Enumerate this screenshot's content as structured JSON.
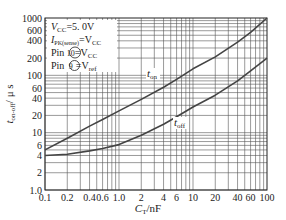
{
  "chart_data": {
    "type": "line",
    "title": "",
    "xlabel": "C_T/nF",
    "ylabel": "t_on-off / μs",
    "xscale": "log",
    "yscale": "log",
    "xlim": [
      0.1,
      100
    ],
    "ylim": [
      1,
      1000
    ],
    "grid": true,
    "x_ticks": [
      "0.1",
      "0.2",
      "0.4",
      "0.6",
      "1.0",
      "2",
      "4",
      "6",
      "10",
      "20",
      "40",
      "60",
      "100"
    ],
    "y_ticks": [
      "1.0",
      "2",
      "4",
      "6",
      "10",
      "20",
      "40",
      "60",
      "100",
      "200",
      "400",
      "600",
      "1000"
    ],
    "x": [
      0.1,
      0.2,
      0.4,
      0.6,
      1.0,
      2,
      4,
      6,
      10,
      20,
      40,
      60,
      100
    ],
    "series": [
      {
        "name": "t_on",
        "values": [
          5,
          8,
          13,
          17,
          24,
          38,
          62,
          85,
          130,
          210,
          380,
          560,
          1000
        ]
      },
      {
        "name": "t_off",
        "values": [
          4,
          4.2,
          4.8,
          5.3,
          6.2,
          9,
          14,
          19,
          28,
          45,
          80,
          120,
          200
        ]
      }
    ],
    "annotations": [
      "V_CC=5.0V",
      "I_PK(sense)=V_CC",
      "Pin ⑩=V_CC",
      "Pin ⑨=V_ref"
    ],
    "legend_position": "inline labels"
  },
  "labels": {
    "xlabel_main": "C",
    "xlabel_sub": "T",
    "xlabel_unit": "/nF",
    "ylabel_main": "t",
    "ylabel_sub": "on-off",
    "ylabel_unit": "/ μ s",
    "t_on_main": "t",
    "t_on_sub": "on",
    "t_off_main": "t",
    "t_off_sub": "off",
    "ann1": "V",
    "ann1_sub": "CC",
    "ann1_val": "=5. 0V",
    "ann2": "I",
    "ann2_sub": "PK(sense)",
    "ann2_val": "=V",
    "ann2_val_sub": "CC",
    "ann3": "Pin ",
    "ann3_pin": "10",
    "ann3_val": "=V",
    "ann3_val_sub": "CC",
    "ann4": "Pin ",
    "ann4_pin": "9",
    "ann4_val": "=V",
    "ann4_val_sub": "ref"
  },
  "colors": {
    "grid": "#555555",
    "curve": "#444444",
    "axis": "#222222"
  }
}
